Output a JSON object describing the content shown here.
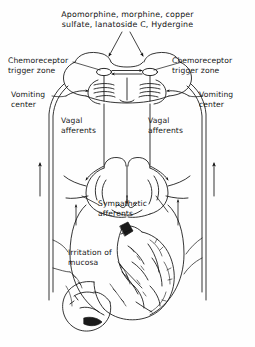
{
  "figure": {
    "name": "emetic-pathways-diagram",
    "type": "anatomical-line-drawing",
    "background_color": "#fefefe",
    "ink_color": "#111111"
  },
  "title": {
    "line1": "Apomorphine, morphine, copper",
    "line2": "sulfate, lanatoside C, Hydergine"
  },
  "labels": {
    "ctz_left": "Chemoreceptor\ntrigger zone",
    "ctz_right": "Chemoreceptor\ntrigger zone",
    "vomiting_center_left": "Vomiting\ncenter",
    "vomiting_center_right": "Vomiting\ncenter",
    "vagal_afferents_left": "Vagal\nafferents",
    "vagal_afferents_right": "Vagal\nafferents",
    "sympathetic_afferents": "Sympathetic\nafferents",
    "irritation_of_mucosa": "Irritation of\nmucosa"
  },
  "structures": [
    {
      "name": "brainstem",
      "region": "top-center"
    },
    {
      "name": "chemoreceptor-trigger-zone-node-left",
      "region": "top-center-left"
    },
    {
      "name": "chemoreceptor-trigger-zone-node-right",
      "region": "top-center-right"
    },
    {
      "name": "medulla-vomiting-center",
      "region": "upper-center"
    },
    {
      "name": "lungs-thorax",
      "region": "middle-center"
    },
    {
      "name": "stomach",
      "region": "lower-center"
    },
    {
      "name": "duodenum",
      "region": "bottom-left"
    },
    {
      "name": "vagus-nerve-trunk-left",
      "region": "left-vertical"
    },
    {
      "name": "vagus-nerve-trunk-right",
      "region": "right-vertical"
    }
  ],
  "arrows": [
    {
      "name": "drug-arrow-left",
      "direction": "down",
      "target": "chemoreceptor-trigger-zone-node-left"
    },
    {
      "name": "drug-arrow-right",
      "direction": "down",
      "target": "chemoreceptor-trigger-zone-node-right"
    },
    {
      "name": "afferent-arrow-left-trunk",
      "direction": "up"
    },
    {
      "name": "afferent-arrow-right-trunk",
      "direction": "up"
    },
    {
      "name": "afferent-arrow-left-inner",
      "direction": "up"
    },
    {
      "name": "afferent-arrow-right-inner",
      "direction": "up"
    }
  ]
}
